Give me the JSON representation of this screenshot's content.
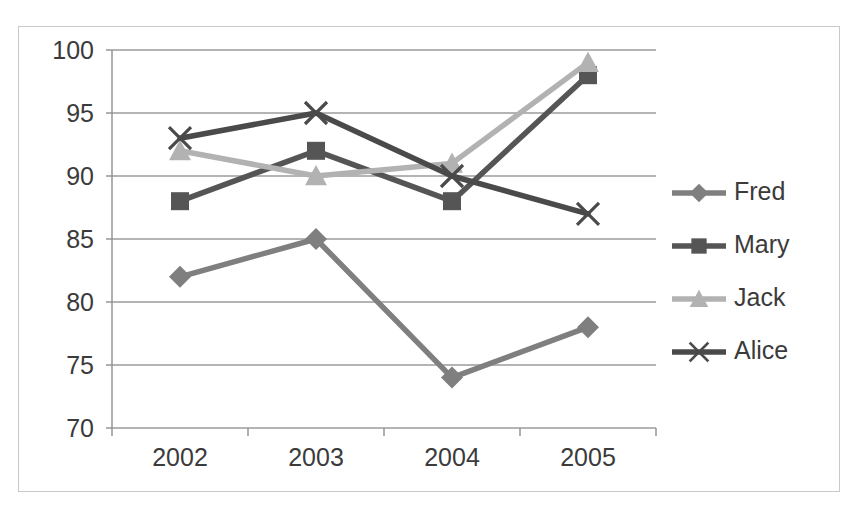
{
  "chart_data": {
    "type": "line",
    "title": "",
    "subtitle": "",
    "xlabel": "",
    "ylabel": "",
    "categories": [
      "2002",
      "2003",
      "2004",
      "2005"
    ],
    "ylim": [
      70,
      100
    ],
    "yticks": [
      70,
      75,
      80,
      85,
      90,
      95,
      100
    ],
    "ytick_labels": [
      "70",
      "75",
      "80",
      "85",
      "90",
      "95",
      "100"
    ],
    "grid": true,
    "grid_axis": "y",
    "legend_position": "right",
    "series": [
      {
        "name": "Fred",
        "marker": "diamond",
        "color": "#7f7f7f",
        "values": [
          82,
          85,
          74,
          78
        ]
      },
      {
        "name": "Mary",
        "marker": "square",
        "color": "#555555",
        "values": [
          88,
          92,
          88,
          98
        ]
      },
      {
        "name": "Jack",
        "marker": "triangle",
        "color": "#b2b2b2",
        "values": [
          92,
          90,
          91,
          99
        ]
      },
      {
        "name": "Alice",
        "marker": "x",
        "color": "#4a4a4a",
        "values": [
          93,
          95,
          90,
          87
        ]
      }
    ]
  },
  "axes": {
    "y_tick_labels": [
      "100",
      "95",
      "90",
      "85",
      "80",
      "75",
      "70"
    ],
    "x_tick_labels": [
      "2002",
      "2003",
      "2004",
      "2005"
    ]
  },
  "legend": {
    "entries": [
      {
        "label": "Fred"
      },
      {
        "label": "Mary"
      },
      {
        "label": "Jack"
      },
      {
        "label": "Alice"
      }
    ]
  },
  "colors": {
    "frame_border": "#c9c9c9",
    "gridline": "#9b9b9b",
    "axis_line": "#8f8f8f",
    "background": "#ffffff",
    "text": "#3b3b3b"
  }
}
